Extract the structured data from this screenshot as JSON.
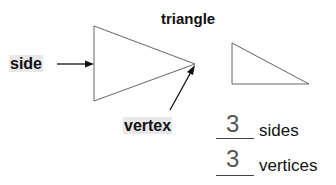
{
  "title": "triangle",
  "labels": {
    "side": "side",
    "vertex": "vertex"
  },
  "answers": [
    {
      "value": "3",
      "label": "sides"
    },
    {
      "value": "3",
      "label": "vertices"
    }
  ],
  "colors": {
    "stroke": "#555555",
    "label_bg": "#e8e8e8"
  }
}
